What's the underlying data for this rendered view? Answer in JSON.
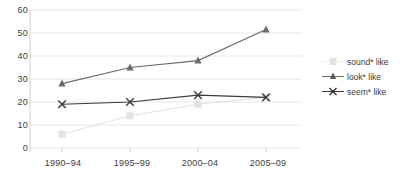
{
  "chart_data": {
    "type": "line",
    "title": "",
    "xlabel": "",
    "ylabel": "",
    "categories": [
      "1990–94",
      "1995–99",
      "2000–04",
      "2005–09"
    ],
    "ylim": [
      0,
      60
    ],
    "yticks": [
      0,
      10,
      20,
      30,
      40,
      50,
      60
    ],
    "grid": true,
    "legend_position": "right",
    "series": [
      {
        "name": "sound* like",
        "values": [
          6,
          14,
          19,
          22
        ],
        "color": "#e2e2e2",
        "marker": "square"
      },
      {
        "name": "look* like",
        "values": [
          28,
          35,
          38,
          51.5
        ],
        "color": "#6b6b6b",
        "marker": "triangle"
      },
      {
        "name": "seem* like",
        "values": [
          19,
          20,
          23,
          22
        ],
        "color": "#3a3a3a",
        "marker": "x"
      }
    ]
  },
  "axis": {
    "y_tick_labels": [
      "60",
      "50",
      "40",
      "30",
      "20",
      "10",
      "0"
    ],
    "x_tick_labels": [
      "1990–94",
      "1995–99",
      "2000–04",
      "2005–09"
    ]
  },
  "legend": {
    "items": [
      {
        "label": "sound* like",
        "marker_name": "legend-marker-square-sound"
      },
      {
        "label": "look* like",
        "marker_name": "legend-marker-triangle-look"
      },
      {
        "label": "seem* like",
        "marker_name": "legend-marker-x-seem"
      }
    ]
  },
  "colors": {
    "grid": "#e6e6e6",
    "axis": "#cfcfcf",
    "text": "#3b3b3b",
    "series_sound": "#e2e2e2",
    "series_look": "#6b6b6b",
    "series_seem": "#3a3a3a"
  }
}
